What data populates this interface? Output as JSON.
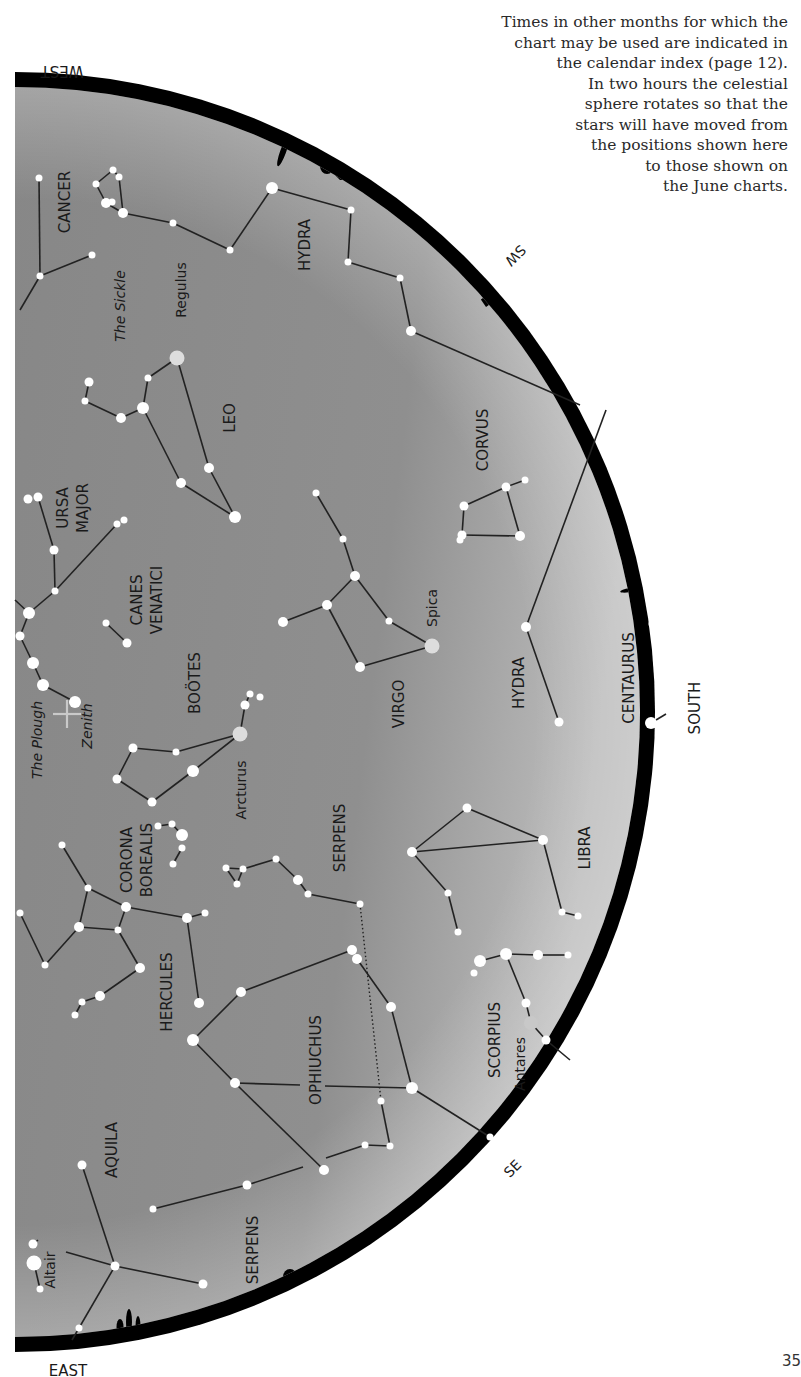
{
  "caption": {
    "lines": [
      "Times in other months for which the",
      "chart may be used are indicated in",
      "the calendar index (page 12).",
      "In two hours the celestial",
      "sphere rotates so that the",
      "stars will have moved from",
      "the positions shown here",
      "to those shown on",
      "the June charts."
    ]
  },
  "page_number": "35",
  "colors": {
    "sky_top": "#8c8c8c",
    "sky_bottom": "#b5b5b5",
    "horizon": "#000000",
    "star": "#ffffff",
    "bright_star": "#dddddd",
    "line": "#222222",
    "text": "#1a1a1a"
  },
  "compass": [
    {
      "label": "WEST",
      "x": 62,
      "y": 66,
      "rotate": 180,
      "size": 15
    },
    {
      "label": "SW",
      "x": 512,
      "y": 252,
      "rotate": 135,
      "size": 14
    },
    {
      "label": "SOUTH",
      "x": 700,
      "y": 708,
      "rotate": -90,
      "size": 15
    },
    {
      "label": "SE",
      "x": 516,
      "y": 1172,
      "rotate": -45,
      "size": 14
    },
    {
      "label": "EAST",
      "x": 68,
      "y": 1376,
      "rotate": 0,
      "size": 15
    }
  ],
  "constellation_labels": [
    {
      "label": "CANCER",
      "x": 70,
      "y": 202,
      "size": 15
    },
    {
      "label": "HYDRA",
      "x": 310,
      "y": 245,
      "size": 15
    },
    {
      "label": "The Sickle",
      "x": 125,
      "y": 306,
      "size": 14,
      "italic": true
    },
    {
      "label": "Regulus",
      "x": 186,
      "y": 290,
      "size": 14
    },
    {
      "label": "LEO",
      "x": 235,
      "y": 418,
      "size": 15
    },
    {
      "label": "CORVUS",
      "x": 488,
      "y": 440,
      "size": 15
    },
    {
      "label": "URSA",
      "x": 68,
      "y": 508,
      "size": 15
    },
    {
      "label": "MAJOR",
      "x": 88,
      "y": 508,
      "size": 15
    },
    {
      "label": "CANES",
      "x": 142,
      "y": 600,
      "size": 15
    },
    {
      "label": "VENATICI",
      "x": 162,
      "y": 600,
      "size": 15
    },
    {
      "label": "Spica",
      "x": 437,
      "y": 608,
      "size": 14
    },
    {
      "label": "HYDRA",
      "x": 524,
      "y": 683,
      "size": 15
    },
    {
      "label": "CENTAURUS",
      "x": 634,
      "y": 678,
      "size": 15
    },
    {
      "label": "BOÖTES",
      "x": 200,
      "y": 683,
      "size": 15
    },
    {
      "label": "VIRGO",
      "x": 404,
      "y": 704,
      "size": 15
    },
    {
      "label": "The Plough",
      "x": 42,
      "y": 740,
      "size": 14,
      "italic": true
    },
    {
      "label": "Zenith",
      "x": 92,
      "y": 726,
      "size": 14,
      "italic": true
    },
    {
      "label": "Arcturus",
      "x": 246,
      "y": 790,
      "size": 14
    },
    {
      "label": "SERPENS",
      "x": 345,
      "y": 838,
      "size": 15
    },
    {
      "label": "CORONA",
      "x": 132,
      "y": 860,
      "size": 15
    },
    {
      "label": "BOREALIS",
      "x": 152,
      "y": 860,
      "size": 15
    },
    {
      "label": "LIBRA",
      "x": 590,
      "y": 848,
      "size": 15
    },
    {
      "label": "HERCULES",
      "x": 172,
      "y": 992,
      "size": 15
    },
    {
      "label": "OPHIUCHUS",
      "x": 321,
      "y": 1060,
      "size": 15
    },
    {
      "label": "SCORPIUS",
      "x": 500,
      "y": 1040,
      "size": 15
    },
    {
      "label": "Antares",
      "x": 525,
      "y": 1064,
      "size": 14
    },
    {
      "label": "AQUILA",
      "x": 117,
      "y": 1150,
      "size": 15
    },
    {
      "label": "SERPENS",
      "x": 258,
      "y": 1250,
      "size": 15
    },
    {
      "label": "Altair",
      "x": 55,
      "y": 1270,
      "size": 14
    }
  ],
  "stars": [
    {
      "x": 39,
      "y": 178,
      "r": 3.5
    },
    {
      "x": 40,
      "y": 276,
      "r": 3.5
    },
    {
      "x": 92,
      "y": 255,
      "r": 3.5
    },
    {
      "x": 113,
      "y": 170,
      "r": 3.5
    },
    {
      "x": 119,
      "y": 177,
      "r": 3.5
    },
    {
      "x": 96,
      "y": 184,
      "r": 3.5
    },
    {
      "x": 106,
      "y": 203,
      "r": 5
    },
    {
      "x": 112,
      "y": 202,
      "r": 3.5
    },
    {
      "x": 123,
      "y": 213,
      "r": 5
    },
    {
      "x": 173,
      "y": 223,
      "r": 3.5
    },
    {
      "x": 230,
      "y": 250,
      "r": 3.5
    },
    {
      "x": 272,
      "y": 188,
      "r": 6
    },
    {
      "x": 351,
      "y": 210,
      "r": 3.5
    },
    {
      "x": 348,
      "y": 262,
      "r": 3.5
    },
    {
      "x": 400,
      "y": 278,
      "r": 3.5
    },
    {
      "x": 411,
      "y": 331,
      "r": 5
    },
    {
      "x": 177,
      "y": 358,
      "r": 7.5,
      "color": "#dddddd"
    },
    {
      "x": 148,
      "y": 378,
      "r": 3.5
    },
    {
      "x": 143,
      "y": 408,
      "r": 6
    },
    {
      "x": 121,
      "y": 418,
      "r": 5
    },
    {
      "x": 85,
      "y": 401,
      "r": 3.5
    },
    {
      "x": 89,
      "y": 382,
      "r": 4.5
    },
    {
      "x": 209,
      "y": 468,
      "r": 5
    },
    {
      "x": 181,
      "y": 483,
      "r": 5
    },
    {
      "x": 235,
      "y": 517,
      "r": 6
    },
    {
      "x": 28,
      "y": 499,
      "r": 4.5
    },
    {
      "x": 38,
      "y": 497,
      "r": 4.5
    },
    {
      "x": 54,
      "y": 550,
      "r": 4.5
    },
    {
      "x": 55,
      "y": 591,
      "r": 3.5
    },
    {
      "x": 117,
      "y": 524,
      "r": 3.5
    },
    {
      "x": 124,
      "y": 520,
      "r": 3.5
    },
    {
      "x": 29,
      "y": 613,
      "r": 6
    },
    {
      "x": 20,
      "y": 636,
      "r": 4.5
    },
    {
      "x": 33,
      "y": 663,
      "r": 6
    },
    {
      "x": 43,
      "y": 685,
      "r": 6
    },
    {
      "x": 75,
      "y": 702,
      "r": 6
    },
    {
      "x": 106,
      "y": 623,
      "r": 3.5
    },
    {
      "x": 127,
      "y": 643,
      "r": 4.5
    },
    {
      "x": 316,
      "y": 493,
      "r": 3.5
    },
    {
      "x": 343,
      "y": 539,
      "r": 3.5
    },
    {
      "x": 355,
      "y": 576,
      "r": 5
    },
    {
      "x": 327,
      "y": 605,
      "r": 5
    },
    {
      "x": 283,
      "y": 622,
      "r": 5
    },
    {
      "x": 389,
      "y": 621,
      "r": 3.5
    },
    {
      "x": 432,
      "y": 646,
      "r": 7.5,
      "color": "#dddddd"
    },
    {
      "x": 360,
      "y": 667,
      "r": 5
    },
    {
      "x": 464,
      "y": 506,
      "r": 4.5
    },
    {
      "x": 506,
      "y": 487,
      "r": 4.5
    },
    {
      "x": 525,
      "y": 480,
      "r": 3.5
    },
    {
      "x": 462,
      "y": 535,
      "r": 4.5
    },
    {
      "x": 460,
      "y": 540,
      "r": 3.5
    },
    {
      "x": 520,
      "y": 536,
      "r": 5
    },
    {
      "x": 526,
      "y": 627,
      "r": 5
    },
    {
      "x": 559,
      "y": 722,
      "r": 4.5
    },
    {
      "x": 653,
      "y": 624,
      "r": 4.5
    },
    {
      "x": 651,
      "y": 723,
      "r": 6
    },
    {
      "x": 240,
      "y": 734,
      "r": 7.5,
      "color": "#dddddd"
    },
    {
      "x": 245,
      "y": 705,
      "r": 4.5
    },
    {
      "x": 250,
      "y": 694,
      "r": 3.5
    },
    {
      "x": 260,
      "y": 697,
      "r": 3.5
    },
    {
      "x": 133,
      "y": 748,
      "r": 4.5
    },
    {
      "x": 176,
      "y": 752,
      "r": 3.5
    },
    {
      "x": 193,
      "y": 771,
      "r": 6
    },
    {
      "x": 117,
      "y": 779,
      "r": 4.5
    },
    {
      "x": 152,
      "y": 802,
      "r": 4.5
    },
    {
      "x": 158,
      "y": 826,
      "r": 3.5
    },
    {
      "x": 172,
      "y": 824,
      "r": 3.5
    },
    {
      "x": 182,
      "y": 835,
      "r": 6
    },
    {
      "x": 182,
      "y": 848,
      "r": 3.5
    },
    {
      "x": 173,
      "y": 864,
      "r": 3.5
    },
    {
      "x": 226,
      "y": 868,
      "r": 3.5
    },
    {
      "x": 243,
      "y": 869,
      "r": 3.5
    },
    {
      "x": 237,
      "y": 884,
      "r": 3.5
    },
    {
      "x": 276,
      "y": 859,
      "r": 3.5
    },
    {
      "x": 298,
      "y": 880,
      "r": 5
    },
    {
      "x": 308,
      "y": 894,
      "r": 3.5
    },
    {
      "x": 360,
      "y": 904,
      "r": 3.5
    },
    {
      "x": 467,
      "y": 808,
      "r": 4.5
    },
    {
      "x": 412,
      "y": 852,
      "r": 5
    },
    {
      "x": 543,
      "y": 840,
      "r": 5
    },
    {
      "x": 448,
      "y": 893,
      "r": 3.5
    },
    {
      "x": 458,
      "y": 932,
      "r": 3.5
    },
    {
      "x": 562,
      "y": 912,
      "r": 3.5
    },
    {
      "x": 578,
      "y": 916,
      "r": 3.5
    },
    {
      "x": 62,
      "y": 845,
      "r": 3.5
    },
    {
      "x": 88,
      "y": 888,
      "r": 3.5
    },
    {
      "x": 126,
      "y": 907,
      "r": 5
    },
    {
      "x": 79,
      "y": 927,
      "r": 5
    },
    {
      "x": 118,
      "y": 930,
      "r": 3.5
    },
    {
      "x": 45,
      "y": 965,
      "r": 3.5
    },
    {
      "x": 20,
      "y": 913,
      "r": 3.5
    },
    {
      "x": 140,
      "y": 968,
      "r": 5
    },
    {
      "x": 100,
      "y": 996,
      "r": 5
    },
    {
      "x": 82,
      "y": 1002,
      "r": 3.5
    },
    {
      "x": 75,
      "y": 1015,
      "r": 3.5
    },
    {
      "x": 187,
      "y": 918,
      "r": 5
    },
    {
      "x": 205,
      "y": 913,
      "r": 3.5
    },
    {
      "x": 199,
      "y": 1003,
      "r": 5
    },
    {
      "x": 193,
      "y": 1040,
      "r": 6
    },
    {
      "x": 241,
      "y": 992,
      "r": 5
    },
    {
      "x": 352,
      "y": 950,
      "r": 5
    },
    {
      "x": 357,
      "y": 959,
      "r": 5
    },
    {
      "x": 391,
      "y": 1007,
      "r": 5
    },
    {
      "x": 235,
      "y": 1083,
      "r": 5
    },
    {
      "x": 412,
      "y": 1088,
      "r": 6
    },
    {
      "x": 381,
      "y": 1101,
      "r": 3.5
    },
    {
      "x": 390,
      "y": 1146,
      "r": 3.5
    },
    {
      "x": 365,
      "y": 1145,
      "r": 3.5
    },
    {
      "x": 324,
      "y": 1170,
      "r": 5
    },
    {
      "x": 480,
      "y": 961,
      "r": 6
    },
    {
      "x": 506,
      "y": 954,
      "r": 6
    },
    {
      "x": 538,
      "y": 955,
      "r": 5
    },
    {
      "x": 568,
      "y": 955,
      "r": 3.5
    },
    {
      "x": 474,
      "y": 973,
      "r": 3.5
    },
    {
      "x": 526,
      "y": 1003,
      "r": 4.5
    },
    {
      "x": 531,
      "y": 1023,
      "r": 7,
      "color": "#c8c8c8"
    },
    {
      "x": 546,
      "y": 1040,
      "r": 4.5
    },
    {
      "x": 490,
      "y": 1137,
      "r": 3.5
    },
    {
      "x": 82,
      "y": 1165,
      "r": 4.5
    },
    {
      "x": 115,
      "y": 1266,
      "r": 4.5
    },
    {
      "x": 203,
      "y": 1284,
      "r": 4.5
    },
    {
      "x": 153,
      "y": 1209,
      "r": 3.5
    },
    {
      "x": 247,
      "y": 1185,
      "r": 4.5
    },
    {
      "x": 33,
      "y": 1244,
      "r": 4.5
    },
    {
      "x": 34,
      "y": 1263,
      "r": 7.5
    },
    {
      "x": 40,
      "y": 1289,
      "r": 3.5
    },
    {
      "x": 79,
      "y": 1328,
      "r": 3.5
    }
  ],
  "lines": [
    [
      39,
      178,
      40,
      276
    ],
    [
      40,
      276,
      92,
      255
    ],
    [
      40,
      276,
      20,
      310
    ],
    [
      96,
      184,
      113,
      170
    ],
    [
      113,
      170,
      119,
      177
    ],
    [
      119,
      177,
      123,
      213
    ],
    [
      96,
      184,
      106,
      203
    ],
    [
      106,
      203,
      123,
      213
    ],
    [
      123,
      213,
      173,
      223
    ],
    [
      173,
      223,
      230,
      250
    ],
    [
      230,
      250,
      272,
      188
    ],
    [
      272,
      188,
      351,
      210
    ],
    [
      351,
      210,
      348,
      262
    ],
    [
      348,
      262,
      400,
      278
    ],
    [
      400,
      278,
      411,
      331
    ],
    [
      411,
      331,
      580,
      405
    ],
    [
      177,
      358,
      148,
      378
    ],
    [
      148,
      378,
      143,
      408
    ],
    [
      143,
      408,
      121,
      418
    ],
    [
      121,
      418,
      85,
      401
    ],
    [
      85,
      401,
      89,
      382
    ],
    [
      177,
      358,
      209,
      468
    ],
    [
      209,
      468,
      235,
      517
    ],
    [
      143,
      408,
      181,
      483
    ],
    [
      181,
      483,
      235,
      517
    ],
    [
      38,
      497,
      54,
      550
    ],
    [
      54,
      550,
      55,
      591
    ],
    [
      55,
      591,
      117,
      524
    ],
    [
      55,
      591,
      29,
      613
    ],
    [
      29,
      613,
      15,
      600
    ],
    [
      29,
      613,
      20,
      636
    ],
    [
      20,
      636,
      33,
      663
    ],
    [
      33,
      663,
      43,
      685
    ],
    [
      43,
      685,
      75,
      702
    ],
    [
      106,
      623,
      127,
      643
    ],
    [
      316,
      493,
      343,
      539
    ],
    [
      343,
      539,
      355,
      576
    ],
    [
      355,
      576,
      327,
      605
    ],
    [
      327,
      605,
      283,
      622
    ],
    [
      355,
      576,
      389,
      621
    ],
    [
      389,
      621,
      432,
      646
    ],
    [
      432,
      646,
      360,
      667
    ],
    [
      327,
      605,
      360,
      667
    ],
    [
      464,
      506,
      506,
      487
    ],
    [
      506,
      487,
      525,
      480
    ],
    [
      506,
      487,
      520,
      536
    ],
    [
      464,
      506,
      462,
      535
    ],
    [
      462,
      535,
      520,
      536
    ],
    [
      606,
      410,
      526,
      627
    ],
    [
      526,
      627,
      559,
      722
    ],
    [
      651,
      723,
      666,
      714
    ],
    [
      240,
      734,
      245,
      705
    ],
    [
      245,
      705,
      250,
      694
    ],
    [
      240,
      734,
      176,
      752
    ],
    [
      176,
      752,
      133,
      748
    ],
    [
      133,
      748,
      117,
      779
    ],
    [
      117,
      779,
      152,
      802
    ],
    [
      152,
      802,
      193,
      771
    ],
    [
      193,
      771,
      240,
      734
    ],
    [
      158,
      826,
      172,
      824
    ],
    [
      172,
      824,
      182,
      835
    ],
    [
      182,
      848,
      173,
      864
    ],
    [
      226,
      868,
      243,
      869
    ],
    [
      243,
      869,
      237,
      884
    ],
    [
      237,
      884,
      226,
      868
    ],
    [
      243,
      869,
      276,
      859
    ],
    [
      276,
      859,
      298,
      880
    ],
    [
      298,
      880,
      308,
      894
    ],
    [
      308,
      894,
      360,
      904
    ],
    [
      412,
      852,
      467,
      808
    ],
    [
      467,
      808,
      543,
      840
    ],
    [
      412,
      852,
      543,
      840
    ],
    [
      412,
      852,
      448,
      893
    ],
    [
      448,
      893,
      458,
      932
    ],
    [
      543,
      840,
      562,
      912
    ],
    [
      562,
      912,
      578,
      916
    ],
    [
      62,
      845,
      88,
      888
    ],
    [
      88,
      888,
      126,
      907
    ],
    [
      88,
      888,
      79,
      927
    ],
    [
      79,
      927,
      118,
      930
    ],
    [
      126,
      907,
      118,
      930
    ],
    [
      79,
      927,
      45,
      965
    ],
    [
      45,
      965,
      20,
      913
    ],
    [
      118,
      930,
      140,
      968
    ],
    [
      140,
      968,
      100,
      996
    ],
    [
      100,
      996,
      82,
      1002
    ],
    [
      82,
      1002,
      75,
      1015
    ],
    [
      126,
      907,
      187,
      918
    ],
    [
      187,
      918,
      205,
      913
    ],
    [
      187,
      918,
      199,
      1003
    ],
    [
      193,
      1040,
      241,
      992
    ],
    [
      241,
      992,
      352,
      950
    ],
    [
      357,
      959,
      391,
      1007
    ],
    [
      391,
      1007,
      412,
      1088
    ],
    [
      193,
      1040,
      235,
      1083
    ],
    [
      235,
      1083,
      300,
      1085
    ],
    [
      325,
      1086,
      412,
      1088
    ],
    [
      412,
      1088,
      490,
      1137
    ],
    [
      235,
      1083,
      324,
      1170
    ],
    [
      381,
      1101,
      390,
      1146
    ],
    [
      390,
      1146,
      365,
      1145
    ],
    [
      365,
      1145,
      326,
      1158
    ],
    [
      506,
      954,
      480,
      961
    ],
    [
      506,
      954,
      538,
      955
    ],
    [
      538,
      955,
      568,
      955
    ],
    [
      506,
      954,
      526,
      1003
    ],
    [
      526,
      1003,
      531,
      1023
    ],
    [
      531,
      1023,
      546,
      1040
    ],
    [
      546,
      1040,
      570,
      1060
    ],
    [
      82,
      1165,
      115,
      1266
    ],
    [
      115,
      1266,
      203,
      1284
    ],
    [
      115,
      1266,
      66,
      1252
    ],
    [
      115,
      1266,
      79,
      1328
    ],
    [
      79,
      1328,
      72,
      1340
    ],
    [
      153,
      1209,
      247,
      1185
    ],
    [
      247,
      1185,
      303,
      1167
    ],
    [
      33,
      1244,
      38,
      1240
    ],
    [
      34,
      1263,
      40,
      1289
    ]
  ],
  "dotted_lines": [
    [
      360,
      904,
      381,
      1101
    ]
  ],
  "zenith": {
    "x": 67,
    "y": 714,
    "size": 14
  }
}
